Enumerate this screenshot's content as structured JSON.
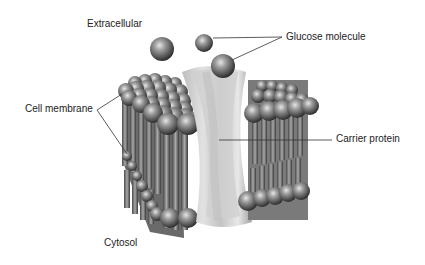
{
  "diagram": {
    "labels": {
      "extracellular": "Extracellular",
      "glucose": "Glucose molecule",
      "cell_membrane": "Cell membrane",
      "carrier_protein": "Carrier protein",
      "cytosol": "Cytosol"
    },
    "colors": {
      "background": "#ffffff",
      "text": "#222222",
      "leader_line": "#333333",
      "sphere_dark": "#3a3a3a",
      "sphere_light": "#bdbdbd",
      "protein_light": "#d9d9d9",
      "protein_dark": "#a8a8a8"
    }
  }
}
